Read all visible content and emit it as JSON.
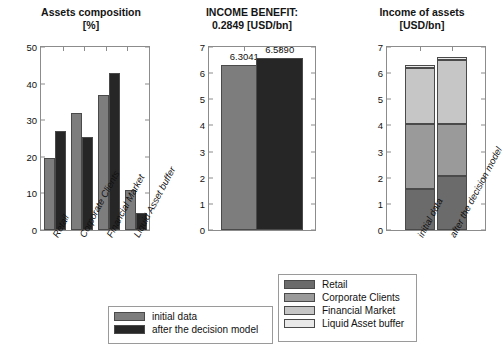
{
  "figure": {
    "background": "#ffffff",
    "colors": {
      "initial_data": "#7d7d7d",
      "after_decision_model": "#262626",
      "retail": "#6b6b6b",
      "corporate_clients": "#9a9a9a",
      "financial_market": "#c6c6c6",
      "liquid_asset_buffer": "#e9e9e9",
      "axis": "#8c8c8c"
    }
  },
  "chart_data": [
    {
      "id": "assets-composition",
      "type": "bar",
      "title": "Assets composition",
      "subtitle": "[%]",
      "xlabel": "",
      "ylabel": "",
      "ylim": [
        0,
        50
      ],
      "yticks": [
        0,
        10,
        20,
        30,
        40,
        50
      ],
      "grid": false,
      "legend_position": "bottom-left",
      "categories": [
        "Retail",
        "Corporate Clients",
        "Financial Market",
        "Liquid Asset buffer"
      ],
      "series": [
        {
          "name": "initial data",
          "color": "#7d7d7d",
          "values": [
            19.8,
            32.0,
            36.8,
            11.0
          ]
        },
        {
          "name": "after the decision model",
          "color": "#262626",
          "values": [
            27.0,
            25.3,
            43.0,
            4.7
          ]
        }
      ]
    },
    {
      "id": "income-benefit",
      "type": "bar",
      "title": "INCOME BENEFIT:",
      "subtitle": "0.2849 [USD/bn]",
      "benefit_value": "0.2849",
      "unit": "[USD/bn]",
      "xlabel": "",
      "ylabel": "",
      "ylim": [
        0,
        7
      ],
      "yticks": [
        0,
        1,
        2,
        3,
        4,
        5,
        6,
        7
      ],
      "grid": false,
      "categories": [
        "initial data",
        "after the decision model"
      ],
      "values": [
        6.3041,
        6.589
      ],
      "data_labels": [
        "6.3041",
        "6.5890"
      ],
      "colors": [
        "#7d7d7d",
        "#262626"
      ]
    },
    {
      "id": "income-of-assets",
      "type": "bar",
      "stacked": true,
      "title": "Income of assets",
      "subtitle": "[USD/bn]",
      "xlabel": "",
      "ylabel": "",
      "ylim": [
        0,
        7
      ],
      "yticks": [
        0,
        1,
        2,
        3,
        4,
        5,
        6,
        7
      ],
      "grid": false,
      "legend_position": "bottom-right",
      "categories": [
        "initial data",
        "after the decision model"
      ],
      "series": [
        {
          "name": "Retail",
          "color": "#6b6b6b",
          "values": [
            1.55,
            2.05
          ]
        },
        {
          "name": "Corporate Clients",
          "color": "#9a9a9a",
          "values": [
            2.5,
            2.0
          ]
        },
        {
          "name": "Financial Market",
          "color": "#c6c6c6",
          "values": [
            2.15,
            2.45
          ]
        },
        {
          "name": "Liquid Asset buffer",
          "color": "#e9e9e9",
          "values": [
            0.1,
            0.1
          ]
        }
      ]
    }
  ],
  "legend_models": {
    "items": [
      {
        "label": "initial data",
        "color": "#7d7d7d"
      },
      {
        "label": "after the decision model",
        "color": "#262626"
      }
    ]
  },
  "legend_assets": {
    "items": [
      {
        "label": "Retail",
        "color": "#6b6b6b"
      },
      {
        "label": "Corporate Clients",
        "color": "#9a9a9a"
      },
      {
        "label": "Financial Market",
        "color": "#c6c6c6"
      },
      {
        "label": "Liquid Asset buffer",
        "color": "#e9e9e9"
      }
    ]
  }
}
